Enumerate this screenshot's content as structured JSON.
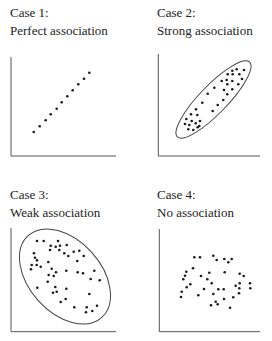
{
  "panels": [
    {
      "case": "Case 1:",
      "title": "Perfect association",
      "label_pos": [
        10,
        4
      ],
      "axes": {
        "x0": 11,
        "y_top": 57,
        "y_bottom": 156,
        "x_right": 116
      },
      "ellipse": null,
      "points": [
        [
          33.7,
          132
        ],
        [
          39.7,
          126.3
        ],
        [
          45.7,
          120.3
        ],
        [
          50.7,
          114.3
        ],
        [
          56.7,
          108.7
        ],
        [
          61.7,
          102.3
        ],
        [
          67.3,
          96.3
        ],
        [
          72.7,
          90.3
        ],
        [
          78.3,
          84.3
        ],
        [
          84,
          78.7
        ],
        [
          89.3,
          72.7
        ]
      ]
    },
    {
      "case": "Case 2:",
      "title": "Strong association",
      "label_pos": [
        157,
        4
      ],
      "axes": {
        "x0": 158.3,
        "y_top": 54,
        "y_bottom": 156,
        "x_right": 260
      },
      "ellipse": {
        "cx": 213.5,
        "cy": 99.5,
        "rx": 52,
        "ry": 14,
        "angle": -46
      },
      "points": [
        [
          232.3,
          70.7
        ],
        [
          236.7,
          69.3
        ],
        [
          244,
          70
        ],
        [
          227.7,
          74.3
        ],
        [
          232.7,
          74.3
        ],
        [
          239.3,
          74.3
        ],
        [
          221.7,
          81
        ],
        [
          226.7,
          80
        ],
        [
          232.3,
          81
        ],
        [
          242,
          79
        ],
        [
          227.3,
          84.3
        ],
        [
          238.3,
          84.3
        ],
        [
          214.3,
          87.7
        ],
        [
          224,
          90
        ],
        [
          232.3,
          89.3
        ],
        [
          207.7,
          93.7
        ],
        [
          227.3,
          94.3
        ],
        [
          223.3,
          100
        ],
        [
          202.3,
          102.7
        ],
        [
          217.7,
          105
        ],
        [
          212.7,
          111
        ],
        [
          196,
          109.3
        ],
        [
          191,
          114.3
        ],
        [
          197.3,
          115
        ],
        [
          186.3,
          119
        ],
        [
          191.7,
          121
        ],
        [
          200,
          121
        ],
        [
          185,
          124
        ],
        [
          189.3,
          125
        ],
        [
          195.7,
          123.3
        ],
        [
          199.3,
          126
        ],
        [
          188.3,
          129.3
        ],
        [
          193.3,
          130
        ],
        [
          197.7,
          127.3
        ]
      ]
    },
    {
      "case": "Case 3:",
      "title": "Weak association",
      "label_pos": [
        10,
        186
      ],
      "axes": {
        "x0": 11,
        "y_top": 228,
        "y_bottom": 331.7,
        "x_right": 116
      },
      "ellipse": {
        "cx": 65,
        "cy": 276.5,
        "rx": 55,
        "ry": 36,
        "angle": 48
      },
      "points": [
        [
          37,
          241
        ],
        [
          43.7,
          241
        ],
        [
          58,
          241
        ],
        [
          50.7,
          245.7
        ],
        [
          55.7,
          246.7
        ],
        [
          60,
          245.7
        ],
        [
          66.7,
          245
        ],
        [
          50,
          250
        ],
        [
          59.3,
          250
        ],
        [
          64.3,
          253.3
        ],
        [
          68.3,
          256
        ],
        [
          73.7,
          251.7
        ],
        [
          79.3,
          250.7
        ],
        [
          83.7,
          256
        ],
        [
          34,
          253.3
        ],
        [
          35,
          257.7
        ],
        [
          37,
          260.3
        ],
        [
          48.3,
          262
        ],
        [
          77.3,
          261
        ],
        [
          31.7,
          265
        ],
        [
          36.7,
          265
        ],
        [
          40.7,
          266.7
        ],
        [
          31,
          269.3
        ],
        [
          51.7,
          268.7
        ],
        [
          56,
          272.3
        ],
        [
          66.3,
          270.7
        ],
        [
          77.7,
          272.3
        ],
        [
          83,
          273.3
        ],
        [
          94.3,
          270.7
        ],
        [
          48.7,
          275
        ],
        [
          53.7,
          276
        ],
        [
          90.7,
          279
        ],
        [
          99.7,
          280.3
        ],
        [
          47.7,
          281.7
        ],
        [
          37.3,
          287.7
        ],
        [
          55.3,
          287
        ],
        [
          66.3,
          288.7
        ],
        [
          53,
          292.7
        ],
        [
          56.7,
          291.7
        ],
        [
          89.3,
          294
        ],
        [
          65.7,
          299
        ],
        [
          60.7,
          302
        ],
        [
          74.3,
          307.3
        ],
        [
          86.7,
          307.3
        ],
        [
          97,
          305.7
        ],
        [
          92.3,
          311
        ],
        [
          86,
          312.3
        ]
      ]
    },
    {
      "case": "Case 4:",
      "title": "No association",
      "label_pos": [
        157,
        186
      ],
      "axes": {
        "x0": 159.3,
        "y_top": 229,
        "y_bottom": 331.7,
        "x_right": 260
      },
      "ellipse": null,
      "points": [
        [
          194.3,
          257.3
        ],
        [
          200,
          257.3
        ],
        [
          213.3,
          255.7
        ],
        [
          216.7,
          260
        ],
        [
          224.3,
          259
        ],
        [
          228.3,
          262.3
        ],
        [
          231.7,
          259
        ],
        [
          193,
          268.3
        ],
        [
          186.3,
          271.7
        ],
        [
          185,
          275.7
        ],
        [
          183.3,
          279.3
        ],
        [
          201,
          276
        ],
        [
          209.3,
          272.7
        ],
        [
          224.7,
          272.3
        ],
        [
          239.7,
          273.7
        ],
        [
          243.7,
          276
        ],
        [
          207.3,
          279.3
        ],
        [
          211.7,
          283.3
        ],
        [
          190.3,
          284.3
        ],
        [
          186.7,
          287.3
        ],
        [
          235.7,
          285.7
        ],
        [
          239.7,
          283.3
        ],
        [
          250,
          283.3
        ],
        [
          204,
          289
        ],
        [
          218.3,
          289.3
        ],
        [
          223.7,
          289.3
        ],
        [
          239.3,
          288.3
        ],
        [
          250.3,
          288.3
        ],
        [
          181.7,
          291.7
        ],
        [
          181,
          297
        ],
        [
          198.3,
          295.3
        ],
        [
          213.3,
          294
        ],
        [
          239,
          293.3
        ],
        [
          224,
          299
        ],
        [
          233.3,
          297.3
        ],
        [
          215.7,
          301.7
        ],
        [
          211,
          305.3
        ],
        [
          217.7,
          304.3
        ],
        [
          230,
          307.7
        ]
      ]
    }
  ],
  "colors": {
    "ink": "#1a1a1a",
    "axis": "#555555",
    "ellipse": "#444444"
  }
}
